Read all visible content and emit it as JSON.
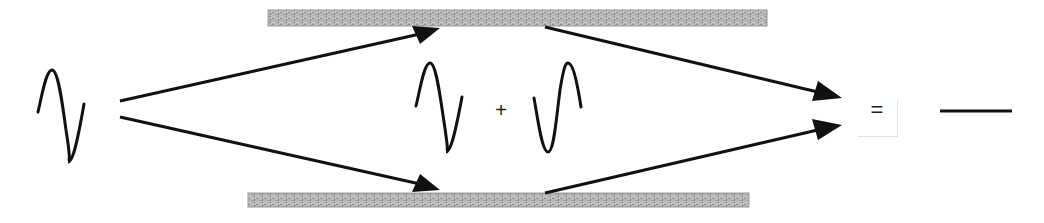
{
  "diagram": {
    "type": "wave-interference",
    "colors": {
      "stroke": "#111111",
      "slab_fill": "#b4b4b4",
      "slab_texture": "#8a8a8a",
      "background": "#ffffff"
    },
    "symbols": {
      "plus": "+",
      "equals": "="
    },
    "elements": {
      "source_wave": "incoming sine wave",
      "top_slab": "upper reflecting surface",
      "bottom_slab": "lower reflecting surface",
      "wave_a": "wave from upper path",
      "wave_b": "wave from lower path (phase-shifted)",
      "result": "flat line (destructive interference)"
    }
  }
}
